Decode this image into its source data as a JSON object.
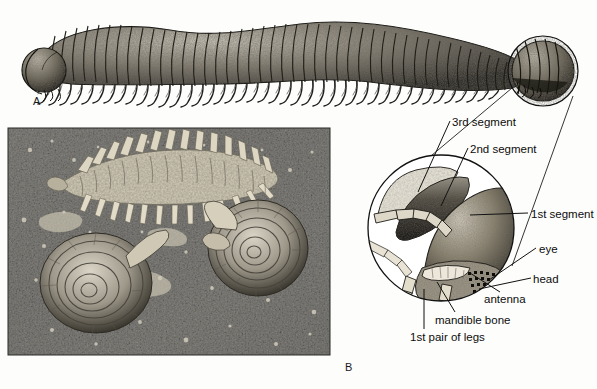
{
  "figure": {
    "panels": [
      {
        "letter": "A",
        "caption": "Line drawing of whole millipede with magnified head detail"
      },
      {
        "letter": "B",
        "caption": "Photograph of flat-backed millipede with two land snails on soil"
      }
    ]
  },
  "panel_letters": {
    "a": "A",
    "b": "B"
  },
  "callouts": {
    "third_segment": "3rd segment",
    "second_segment": "2nd segment",
    "first_segment": "1st segment",
    "eye": "eye",
    "head": "head",
    "antenna": "antenna",
    "mandible_bone": "mandible bone",
    "first_pair_of_legs": "1st pair of legs"
  },
  "colors": {
    "ink": "#0d0d0d",
    "paper": "#fdfdfb",
    "photo_dark": "#121212",
    "photo_light": "#e8e6de",
    "shade_mid": "#6b6558"
  },
  "graphics": {
    "millipede_illustration": "millipede-line-art",
    "head_locator_circle": "small-circle-on-head",
    "magnifier_circle": "magnified-head-circle",
    "photograph": "millipede-and-snails-photo"
  }
}
